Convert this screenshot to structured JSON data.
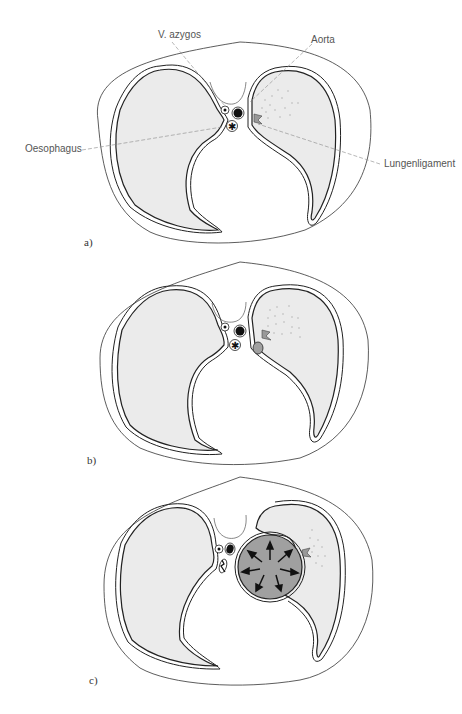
{
  "figure": {
    "panels": [
      {
        "id": "a",
        "label": "a)"
      },
      {
        "id": "b",
        "label": "b)"
      },
      {
        "id": "c",
        "label": "c)"
      }
    ],
    "annotations": {
      "azygos": "V. azygos",
      "aorta": "Aorta",
      "oesophagus": "Oesophagus",
      "ligament": "Lungenligament"
    },
    "colors": {
      "lung_fill": "#ebebeb",
      "outline": "#222222",
      "mass_fill": "#a0a0a0",
      "leader_line": "#888888",
      "dots": "#b5b5b5"
    }
  }
}
